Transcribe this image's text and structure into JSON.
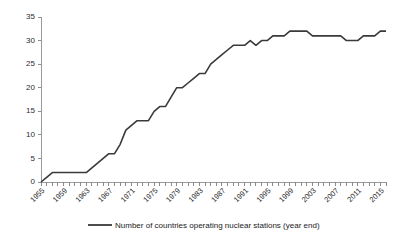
{
  "chart_data": {
    "type": "line",
    "title": "",
    "subtitle": "",
    "xlabel": "",
    "ylabel": "",
    "xlim": [
      1955,
      2016
    ],
    "ylim": [
      0,
      35
    ],
    "yticks": [
      0,
      5,
      10,
      15,
      20,
      25,
      30,
      35
    ],
    "ytick_labels": [
      "0",
      "5",
      "10",
      "15",
      "20",
      "25",
      "30",
      "35"
    ],
    "xtick_labels": [
      "1955",
      "1959",
      "1963",
      "1967",
      "1971",
      "1975",
      "1979",
      "1983",
      "1987",
      "1991",
      "1995",
      "1999",
      "2003",
      "2007",
      "2011",
      "2015"
    ],
    "xtick_values": [
      1955,
      1959,
      1963,
      1967,
      1971,
      1975,
      1979,
      1983,
      1987,
      1991,
      1995,
      1999,
      2003,
      2007,
      2011,
      2015
    ],
    "minor_ticks": "every year from 1955 to 2016",
    "grid": false,
    "legend_position": "bottom",
    "line_color": "#3a3a3a",
    "series": [
      {
        "name": "Number of countries operating nuclear stations (year end)",
        "x": [
          1955,
          1956,
          1957,
          1958,
          1959,
          1960,
          1961,
          1962,
          1963,
          1964,
          1965,
          1966,
          1967,
          1968,
          1969,
          1970,
          1971,
          1972,
          1973,
          1974,
          1975,
          1976,
          1977,
          1978,
          1979,
          1980,
          1981,
          1982,
          1983,
          1984,
          1985,
          1986,
          1987,
          1988,
          1989,
          1990,
          1991,
          1992,
          1993,
          1994,
          1995,
          1996,
          1997,
          1998,
          1999,
          2000,
          2001,
          2002,
          2003,
          2004,
          2005,
          2006,
          2007,
          2008,
          2009,
          2010,
          2011,
          2012,
          2013,
          2014,
          2015,
          2016
        ],
        "values": [
          0,
          1,
          2,
          2,
          2,
          2,
          2,
          2,
          2,
          3,
          4,
          5,
          6,
          6,
          8,
          11,
          12,
          13,
          13,
          13,
          15,
          16,
          16,
          18,
          20,
          20,
          21,
          22,
          23,
          23,
          25,
          26,
          27,
          28,
          29,
          29,
          29,
          30,
          29,
          30,
          30,
          31,
          31,
          31,
          32,
          32,
          32,
          32,
          31,
          31,
          31,
          31,
          31,
          31,
          30,
          30,
          30,
          31,
          31,
          31,
          32,
          32
        ]
      }
    ]
  },
  "legend": {
    "entries": [
      {
        "label": "Number of countries operating nuclear stations (year end)",
        "color": "#3a3a3a"
      }
    ]
  }
}
